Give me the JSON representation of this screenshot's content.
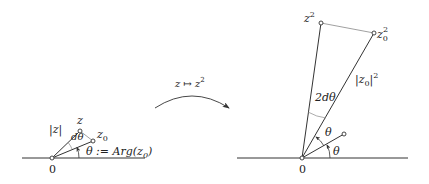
{
  "left_diagram": {
    "origin_label": "0",
    "z_label": "z",
    "z0_label": "z",
    "z0_sub": "0",
    "modulus_label": "|z|",
    "dtheta_label": "dθ",
    "theta_def_label": "θ := Arg(z",
    "theta_def_sub": "0",
    "theta_def_close": ")"
  },
  "arrow": {
    "map_label_base": "z ↦ z",
    "map_label_sup": "2"
  },
  "right_diagram": {
    "origin_label": "0",
    "z2_label": "z",
    "z2_sup": "2",
    "z02_label": "z",
    "z02_sub": "0",
    "z02_sup": "2",
    "modulus_label": "|z",
    "modulus_sub": "0",
    "modulus_close": "|",
    "modulus_sup": "2",
    "two_dtheta_label": "2dθ",
    "theta_upper_label": "θ",
    "theta_lower_label": "θ"
  },
  "colors": {
    "line": "#333333",
    "thin_line": "#888888",
    "text": "#222222"
  }
}
